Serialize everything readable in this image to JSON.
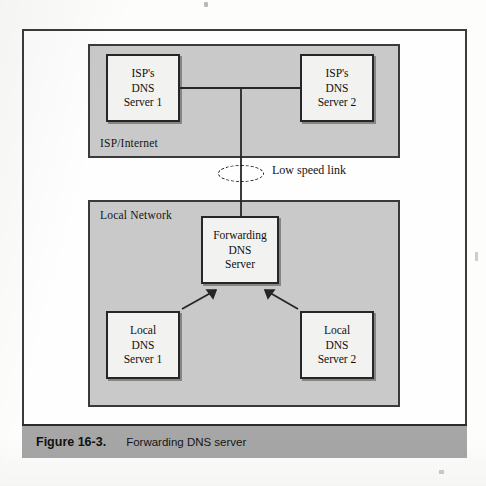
{
  "figure": {
    "caption_number": "Figure 16-3.",
    "caption_text": "Forwarding DNS server"
  },
  "zones": {
    "isp": {
      "label": "ISP/Internet"
    },
    "local": {
      "label": "Local Network"
    }
  },
  "nodes": {
    "isp_dns_1": {
      "line1": "ISP's",
      "line2": "DNS",
      "line3": "Server 1"
    },
    "isp_dns_2": {
      "line1": "ISP's",
      "line2": "DNS",
      "line3": "Server 2"
    },
    "forwarding_dns": {
      "line1": "Forwarding",
      "line2": "DNS",
      "line3": "Server"
    },
    "local_dns_1": {
      "line1": "Local",
      "line2": "DNS",
      "line3": "Server 1"
    },
    "local_dns_2": {
      "line1": "Local",
      "line2": "DNS",
      "line3": "Server 2"
    }
  },
  "annotations": {
    "low_speed_link": "Low speed link"
  },
  "colors": {
    "zone_fill": "#c9c9c9",
    "node_fill": "#f2f2f0",
    "line_stroke": "#262626",
    "caption_bar": "#a6a6a6",
    "page_background": "#fdfdfc"
  }
}
